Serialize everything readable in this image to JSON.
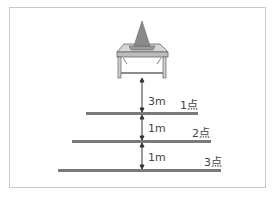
{
  "diagram": {
    "object": "cone-on-table",
    "distances": [
      {
        "label": "3m"
      },
      {
        "label": "1m"
      },
      {
        "label": "1m"
      }
    ],
    "lines": [
      {
        "points_label": "1点"
      },
      {
        "points_label": "2点"
      },
      {
        "points_label": "3点"
      }
    ],
    "colors": {
      "line": "#7a7a7a",
      "cone": "#8a8a8a",
      "table": "#b5b5b5",
      "border": "#c8c8c8"
    }
  }
}
